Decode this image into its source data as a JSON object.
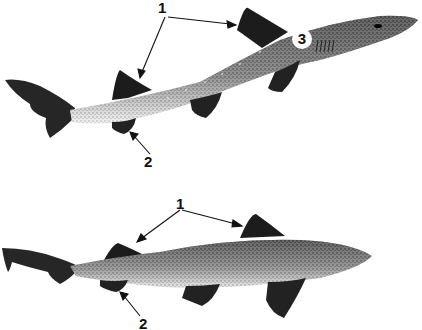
{
  "figure": {
    "top_shark": {
      "name": "upper-shark",
      "callouts": [
        {
          "id": "1",
          "text": "1",
          "targets": [
            "first-dorsal-fin",
            "second-dorsal-fin"
          ]
        },
        {
          "id": "2",
          "text": "2",
          "targets": [
            "anal-fin"
          ]
        },
        {
          "id": "3",
          "text": "3",
          "targets": [
            "spiracle-region"
          ]
        }
      ]
    },
    "bottom_shark": {
      "name": "lower-shark",
      "callouts": [
        {
          "id": "1",
          "text": "1",
          "targets": [
            "first-dorsal-fin",
            "second-dorsal-fin"
          ]
        },
        {
          "id": "2",
          "text": "2",
          "targets": [
            "anal-fin"
          ]
        }
      ]
    },
    "colors": {
      "ink": "#111111",
      "background": "#ffffff"
    }
  }
}
